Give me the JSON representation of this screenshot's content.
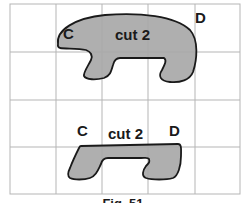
{
  "figure": {
    "caption": "Fig. 51",
    "grid": {
      "cols": 5,
      "rows": 4,
      "line_color": "#b5b5b5"
    },
    "shape_fill": "#a8a8a8",
    "shape_stroke": "#1a1a1a",
    "top_piece": {
      "label_left": "C",
      "label_center": "cut 2",
      "label_right": "D"
    },
    "bottom_piece": {
      "label_left": "C",
      "label_center": "cut 2",
      "label_right": "D"
    }
  }
}
